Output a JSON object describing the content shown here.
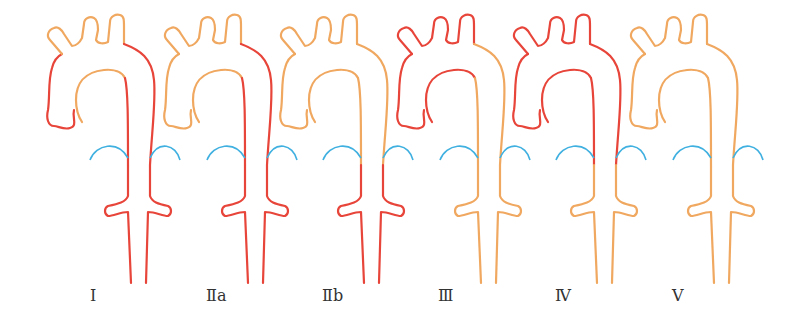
{
  "figure": {
    "colors": {
      "dissected": "#e8453a",
      "normal": "#f0a860",
      "renal_arc": "#3fb0e0"
    },
    "types": [
      {
        "label": "I",
        "offset": 0,
        "ascending": "red",
        "arch_top": "orange",
        "inner_arch": "orange",
        "desc_upper": "red",
        "desc_lower": "red"
      },
      {
        "label": "Ⅱa",
        "offset": 117,
        "ascending": "orange",
        "arch_top": "orange",
        "inner_arch": "orange",
        "desc_upper": "red",
        "desc_lower": "red"
      },
      {
        "label": "Ⅱb",
        "offset": 233,
        "ascending": "orange",
        "arch_top": "orange",
        "inner_arch": "orange",
        "desc_upper": "orange",
        "desc_lower": "red"
      },
      {
        "label": "Ⅲ",
        "offset": 350,
        "ascending": "red",
        "arch_top": "red",
        "inner_arch": "red",
        "desc_upper": "orange",
        "desc_lower": "orange"
      },
      {
        "label": "Ⅳ",
        "offset": 466,
        "ascending": "red",
        "arch_top": "red",
        "inner_arch": "red",
        "desc_upper": "red",
        "desc_lower": "orange"
      },
      {
        "label": "Ⅴ",
        "offset": 583,
        "ascending": "orange",
        "arch_top": "orange",
        "inner_arch": "orange",
        "desc_upper": "orange",
        "desc_lower": "orange"
      }
    ]
  },
  "labels": [
    "Ⅰ",
    "Ⅱa",
    "Ⅱb",
    "Ⅲ",
    "Ⅳ",
    "Ⅴ"
  ]
}
